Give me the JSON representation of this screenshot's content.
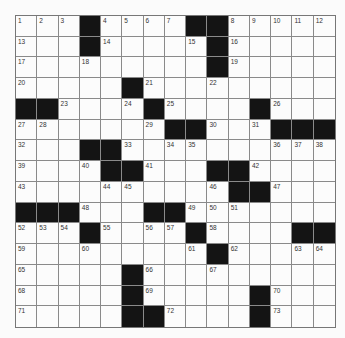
{
  "puzzle": {
    "rows": 15,
    "cols": 15,
    "colors": {
      "black": "#141414",
      "white": "#fcfcfc",
      "line": "#8a8a8a"
    },
    "grid": [
      [
        "1",
        "2",
        "3",
        "#",
        "4",
        "5",
        "6",
        "7",
        "#",
        "#",
        "8",
        "9",
        "10",
        "11",
        "12"
      ],
      [
        "13",
        ".",
        ".",
        "#",
        "14",
        ".",
        ".",
        ".",
        "15",
        "#",
        "16",
        ".",
        ".",
        ".",
        "."
      ],
      [
        "17",
        ".",
        ".",
        "18",
        ".",
        ".",
        ".",
        ".",
        ".",
        "#",
        "19",
        ".",
        ".",
        ".",
        "."
      ],
      [
        "20",
        ".",
        ".",
        ".",
        ".",
        "#",
        "21",
        ".",
        ".",
        "22",
        ".",
        ".",
        ".",
        ".",
        "."
      ],
      [
        "#",
        "#",
        "23",
        ".",
        ".",
        "24",
        "#",
        "25",
        ".",
        ".",
        ".",
        "#",
        "26",
        ".",
        "."
      ],
      [
        "27",
        "28",
        ".",
        ".",
        ".",
        ".",
        "29",
        "#",
        "#",
        "30",
        ".",
        "31",
        "#",
        "#",
        "#"
      ],
      [
        "32",
        ".",
        ".",
        "#",
        "#",
        "33",
        ".",
        "34",
        "35",
        ".",
        ".",
        ".",
        "36",
        "37",
        "38"
      ],
      [
        "39",
        ".",
        ".",
        "40",
        "#",
        "#",
        "41",
        ".",
        ".",
        "#",
        "#",
        "42",
        ".",
        ".",
        "."
      ],
      [
        "43",
        ".",
        ".",
        ".",
        "44",
        "45",
        ".",
        ".",
        ".",
        "46",
        "#",
        "#",
        "47",
        ".",
        "."
      ],
      [
        "#",
        "#",
        "#",
        "48",
        ".",
        ".",
        "#",
        "#",
        "49",
        "50",
        "51",
        ".",
        ".",
        ".",
        "."
      ],
      [
        "52",
        "53",
        "54",
        "#",
        "55",
        ".",
        "56",
        "57",
        "#",
        "58",
        ".",
        ".",
        ".",
        "#",
        "#"
      ],
      [
        "59",
        ".",
        ".",
        "60",
        ".",
        ".",
        ".",
        ".",
        "61",
        "#",
        "62",
        ".",
        ".",
        "63",
        "64"
      ],
      [
        "65",
        ".",
        ".",
        ".",
        ".",
        "#",
        "66",
        ".",
        ".",
        "67",
        ".",
        ".",
        ".",
        ".",
        "."
      ],
      [
        "68",
        ".",
        ".",
        ".",
        ".",
        "#",
        "69",
        ".",
        ".",
        ".",
        ".",
        "#",
        "70",
        ".",
        "."
      ],
      [
        "71",
        ".",
        ".",
        ".",
        ".",
        "#",
        "#",
        "72",
        ".",
        ".",
        ".",
        "#",
        "73",
        ".",
        "."
      ]
    ]
  }
}
